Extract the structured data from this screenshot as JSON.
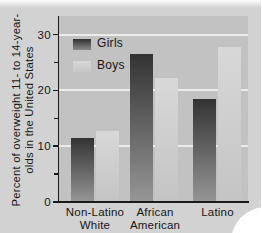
{
  "figure": {
    "y_axis": {
      "label_line1": "Percent of overweight 11- to 14-year-",
      "label_line2": "olds in the United States",
      "tick_labels": [
        "0",
        "10",
        "20",
        "30"
      ]
    },
    "legend": {
      "girls": "Girls",
      "boys": "Boys"
    },
    "x_axis": {
      "category_lines": [
        [
          "Non-Latino",
          "White"
        ],
        [
          "African",
          "American"
        ],
        [
          "Latino"
        ]
      ]
    }
  },
  "chart_data": {
    "type": "bar",
    "categories": [
      "Non-Latino White",
      "African American",
      "Latino"
    ],
    "series": [
      {
        "name": "Girls",
        "values": [
          11.5,
          26.5,
          18.5
        ]
      },
      {
        "name": "Boys",
        "values": [
          12.8,
          22.3,
          27.7
        ]
      }
    ],
    "title": "",
    "xlabel": "",
    "ylabel": "Percent of overweight 11- to 14-year-olds in the United States",
    "ylim": [
      0,
      33
    ],
    "yticks": [
      0,
      10,
      20,
      30
    ],
    "minor_yticks": [
      5,
      15,
      25
    ],
    "gridline_values": [
      10,
      20,
      30
    ],
    "grid": true,
    "legend_position": "upper-left",
    "colors": {
      "girls_bar_top": "#333333",
      "girls_bar_bottom": "#969696",
      "boys_bar_top": "#d8d8d8",
      "boys_bar_bottom": "#c4c4c4",
      "plot_bg": "#c2c2c2",
      "page_bg": "#d2d2d2",
      "gridline": "#ececec",
      "axis": "#1a1a1a"
    }
  }
}
